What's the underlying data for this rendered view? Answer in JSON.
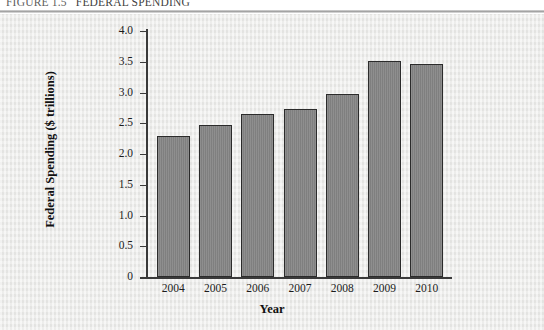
{
  "figure": {
    "number": "FIGURE 1.5",
    "title": "FEDERAL SPENDING"
  },
  "colors": {
    "bar_fill": "#868686",
    "bar_outline": "#2b2b2b",
    "panel_background": "#e9e9e7",
    "axis": "#3a3a3a",
    "text": "#101010"
  },
  "chart_data": {
    "type": "bar",
    "title": "FEDERAL SPENDING",
    "xlabel": "Year",
    "ylabel": "Federal Spending ($ trillions)",
    "categories": [
      "2004",
      "2005",
      "2006",
      "2007",
      "2008",
      "2009",
      "2010"
    ],
    "values": [
      2.29,
      2.47,
      2.65,
      2.73,
      2.98,
      3.52,
      3.46
    ],
    "ylim": [
      0,
      4.0
    ],
    "yticks": [
      0,
      0.5,
      1.0,
      1.5,
      2.0,
      2.5,
      3.0,
      3.5,
      4.0
    ],
    "ytick_labels": [
      "0",
      "0.5",
      "1.0",
      "1.5",
      "2.0",
      "2.5",
      "3.0",
      "3.5",
      "4.0"
    ],
    "grid": false,
    "legend": null
  }
}
